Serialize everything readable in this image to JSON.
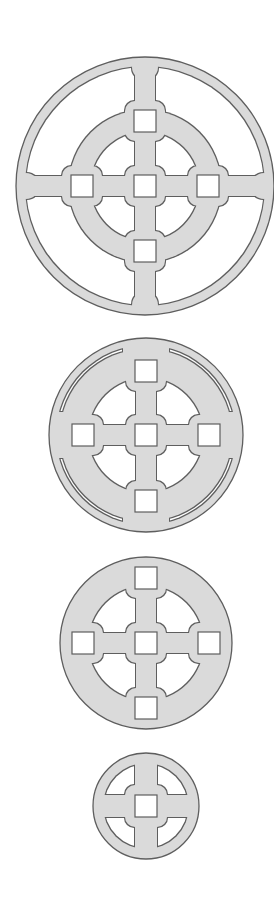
{
  "page": {
    "caption": "Four circular cross-and-ring tracery patterns, decreasing in size"
  },
  "colors": {
    "background": "#ffffff",
    "fill": "#dadada",
    "outline": "#5e5e5e",
    "hole": "#ffffff"
  },
  "figures": [
    {
      "id": "pattern-large",
      "cx": 145,
      "cy": 186,
      "r": 129,
      "outer_ring_inner_r": 120,
      "middle_ring": {
        "outer_r": 76,
        "inner_r": 55
      },
      "bar_width": 20,
      "boss_size": 40,
      "boss_radius": 10,
      "square_size": 22,
      "square_offsets": [
        [
          0,
          0
        ],
        [
          0,
          -65
        ],
        [
          0,
          65
        ],
        [
          -63,
          0
        ],
        [
          63,
          0
        ]
      ],
      "junction_bumps": {
        "distance": 119,
        "r": 13
      }
    },
    {
      "id": "pattern-medium-slotted",
      "cx": 146,
      "cy": 435,
      "r": 97,
      "slot": {
        "outer_r": 90,
        "inner_r": 86,
        "gap_width": 46
      },
      "opening_r": 58,
      "bar_width": 20,
      "boss_size": 40,
      "boss_radius": 10,
      "square_size": 22,
      "square_offsets": [
        [
          0,
          0
        ],
        [
          0,
          -64
        ],
        [
          0,
          66
        ],
        [
          -63,
          0
        ],
        [
          63,
          0
        ]
      ]
    },
    {
      "id": "pattern-medium-solid",
      "cx": 146,
      "cy": 643,
      "r": 86,
      "opening_r": 58,
      "bar_width": 20,
      "boss_size": 40,
      "boss_radius": 10,
      "square_size": 22,
      "square_offsets": [
        [
          0,
          0
        ],
        [
          0,
          -65
        ],
        [
          0,
          65
        ],
        [
          -63,
          0
        ],
        [
          63,
          0
        ]
      ]
    },
    {
      "id": "pattern-small",
      "cx": 146,
      "cy": 806,
      "r": 53,
      "opening_r": 43,
      "bar_width": 22,
      "boss_size": 42,
      "boss_radius": 10,
      "square_size": 22,
      "square_offsets": [
        [
          0,
          0
        ]
      ]
    }
  ]
}
